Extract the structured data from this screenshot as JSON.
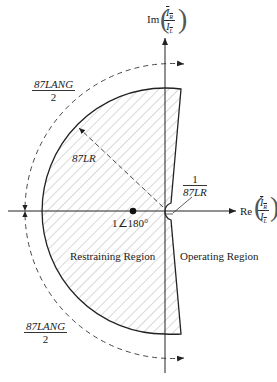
{
  "diagram": {
    "type": "complex-plane restraint characteristic",
    "axes": {
      "imag_label_prefix": "Im",
      "real_label_prefix": "Re",
      "ratio_numerator": "I",
      "numerator_subscript": "R",
      "ratio_denominator": "I",
      "denominator_subscript": "L"
    },
    "labels": {
      "angle_top_num": "87LANG",
      "angle_top_den": "2",
      "angle_bottom_num": "87LANG",
      "angle_bottom_den": "2",
      "radius": "87LR",
      "inner_num": "1",
      "inner_den": "87LR",
      "point": "1∠180°",
      "restraining": "Restraining Region",
      "operating": "Operating Region"
    },
    "colors": {
      "line": "#222222",
      "hatch": "#9a9a9a",
      "background": "#ffffff"
    }
  }
}
